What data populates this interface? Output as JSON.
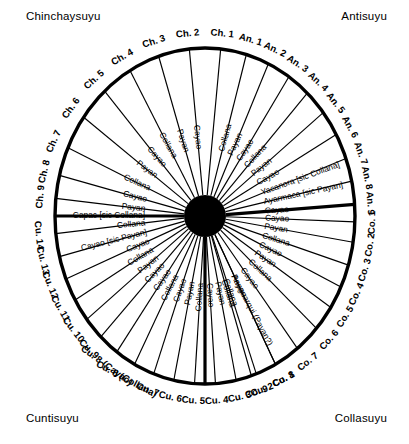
{
  "quadrants": {
    "chinchaysuyu": "Chinchaysuyu",
    "antisuyu": "Antisuyu",
    "cuntisuyu": "Cuntisuyu",
    "collasuyu": "Collasuyu"
  },
  "geometry": {
    "center_x": 205,
    "center_y": 216,
    "radius_x": 150,
    "radius_y": 168,
    "hub_radius": 21
  },
  "chart_data": {
    "type": "radial-diagram",
    "center": "black hub (Cuzco / Coricancha)",
    "quadrant_labels": [
      "Chinchaysuyu",
      "Antisuyu",
      "Collasuyu",
      "Cuntisuyu"
    ],
    "total_rays": 41,
    "quadrants": [
      {
        "name": "Antisuyu",
        "prefix": "An.",
        "ray_count": 9,
        "ray_labels": [
          "An. 1",
          "An. 2",
          "An. 3",
          "An. 4",
          "An. 5",
          "An. 6",
          "An. 7",
          "An. 8",
          "An. 9"
        ],
        "inner_labels": [
          "Collana",
          "Payan",
          "Cayao",
          "Collana",
          "Payan",
          "Cayao",
          "Collana",
          "Payan",
          "Cayao",
          "Yacanora [sic Collana]",
          "Ayarmaca [sic Payan]",
          "Cayao"
        ]
      },
      {
        "name": "Collasuyu",
        "prefix": "Co.",
        "ray_count": 9,
        "ray_labels": [
          "Co. 1",
          "Co. 2",
          "Co. 3",
          "Co. 4",
          "Co. 5",
          "Co. 6",
          "Co. 7",
          "Co. 8",
          "Co. 9"
        ],
        "inner_labels": [
          "Cayao",
          "Payan",
          "Collana",
          "Cayao",
          "Payan",
          "Collana",
          "Cayao",
          "Payan",
          "Collana",
          "Cayao",
          "Payan",
          "Collana",
          "Anaguarqui (Payan?)",
          "Collana"
        ]
      },
      {
        "name": "Cuntisuyu",
        "prefix": "Cu.",
        "ray_count": 14,
        "ray_labels": [
          "Cu. 1",
          "Cu. 2",
          "Cu. 3",
          "Cu. 4",
          "Cu. 5",
          "Cu. 6",
          "Cu. 7",
          "Cu. 8 (Collana)",
          "Cu. 8 (Cayao)",
          "Cu. 9",
          "Cu. 10",
          "Cu. 11",
          "Cu. 12",
          "Cu. 13",
          "Cu. 14"
        ],
        "inner_labels": [
          "Collana",
          "Payan",
          "Cayao",
          "Collana",
          "Cayao",
          "Collana",
          "Payan",
          "Cayao",
          "Collana",
          "Cayao",
          "Cayao [sic Payan]",
          "Collana"
        ]
      },
      {
        "name": "Chinchaysuyu",
        "prefix": "Ch.",
        "ray_count": 9,
        "ray_labels": [
          "Ch. 1",
          "Ch. 2",
          "Ch. 3",
          "Ch. 4",
          "Ch. 5",
          "Ch. 6",
          "Ch. 7",
          "Ch. 8",
          "Ch. 9"
        ],
        "inner_labels": [
          "Cayao",
          "Payan",
          "Collana",
          "Cayao",
          "Payan",
          "Collana",
          "Cayao",
          "Payan",
          "Capac [sic Collana]"
        ]
      }
    ],
    "notes": [
      "Yacanora [sic Collana]",
      "Ayarmaca [sic Payan]",
      "Anaguarqui (Payan?)",
      "Capac [sic Collana]",
      "Cayao [sic Payan]"
    ]
  },
  "rays": [
    {
      "label": "Ch. 1",
      "angle": -84,
      "thick": false,
      "inner": null
    },
    {
      "label": "Ch. 2",
      "angle": -96,
      "thick": false,
      "inner": "Cayao"
    },
    {
      "label": "Ch. 3",
      "angle": -108,
      "thick": false,
      "inner": "Payan"
    },
    {
      "label": "Ch. 4",
      "angle": -120,
      "thick": false,
      "inner": "Collana"
    },
    {
      "label": "Ch. 5",
      "angle": -132,
      "thick": false,
      "inner": "Cayao"
    },
    {
      "label": "Ch. 6",
      "angle": -144,
      "thick": false,
      "inner": "Payan"
    },
    {
      "label": "Ch. 7",
      "angle": -156,
      "thick": false,
      "inner": "Collana"
    },
    {
      "label": "Ch. 8",
      "angle": -166,
      "thick": false,
      "inner": "Cayao"
    },
    {
      "label": "Ch. 9",
      "angle": -174,
      "thick": false,
      "inner": "Payan"
    },
    {
      "label": "",
      "angle": -180,
      "thick": true,
      "inner": "Capac [sic Collana]"
    },
    {
      "label": "Cu. 14",
      "angle": 174,
      "thick": false,
      "inner": "Collana"
    },
    {
      "label": "Cu. 13",
      "angle": 166,
      "thick": false,
      "inner": "Cayao [sic Payan]"
    },
    {
      "label": "Cu. 12",
      "angle": 158,
      "thick": false,
      "inner": "Cayao"
    },
    {
      "label": "Cu. 11",
      "angle": 150,
      "thick": false,
      "inner": "Collana"
    },
    {
      "label": "Cu. 10",
      "angle": 142,
      "thick": false,
      "inner": "Payan"
    },
    {
      "label": "Cu. 9",
      "angle": 134,
      "thick": false,
      "inner": "Cayao"
    },
    {
      "label": "Cu. 8 (Cayao)",
      "angle": 126,
      "thick": false,
      "inner": "Cayao"
    },
    {
      "label": "Cu. 8 (Collana)",
      "angle": 118,
      "thick": false,
      "inner": "Collana"
    },
    {
      "label": "Cu. 7",
      "angle": 110,
      "thick": false,
      "inner": "Cayao"
    },
    {
      "label": "Cu. 6",
      "angle": 102,
      "thick": false,
      "inner": "Payan"
    },
    {
      "label": "Cu. 5",
      "angle": 94,
      "thick": false,
      "inner": "Collana"
    },
    {
      "label": "Cu. 4",
      "angle": 86,
      "thick": false,
      "inner": "Cayao"
    },
    {
      "label": "Cu. 3",
      "angle": 78,
      "thick": false,
      "inner": "Payan"
    },
    {
      "label": "Cu. 2",
      "angle": 70,
      "thick": false,
      "inner": "Collana"
    },
    {
      "label": "Cu. 1",
      "angle": 62,
      "thick": false,
      "inner": "Anaguarqui (Payan?)"
    },
    {
      "label": "",
      "angle": 90,
      "thick": true,
      "inner": null
    },
    {
      "label": "Co. 9",
      "angle": 72,
      "thick": false,
      "inner": "Collana"
    },
    {
      "label": "Co. 8",
      "angle": 62,
      "thick": false,
      "inner": "Payan"
    },
    {
      "label": "Co. 7",
      "angle": 52,
      "thick": false,
      "inner": "Cayao"
    },
    {
      "label": "Co. 6",
      "angle": 42,
      "thick": false,
      "inner": "Collana"
    },
    {
      "label": "Co. 5",
      "angle": 33,
      "thick": false,
      "inner": "Payan"
    },
    {
      "label": "Co. 4",
      "angle": 25,
      "thick": false,
      "inner": "Cayao"
    },
    {
      "label": "Co. 3",
      "angle": 17,
      "thick": false,
      "inner": "Collana"
    },
    {
      "label": "Co. 2",
      "angle": 9,
      "thick": false,
      "inner": "Payan"
    },
    {
      "label": "Co. 1",
      "angle": 2,
      "thick": false,
      "inner": "Cayao"
    },
    {
      "label": "An. 9",
      "angle": -4,
      "thick": true,
      "inner": "Cayao"
    },
    {
      "label": "An. 8",
      "angle": -12,
      "thick": false,
      "inner": "Ayarmaca [sic Payan]"
    },
    {
      "label": "An. 7",
      "angle": -20,
      "thick": false,
      "inner": "Yacanora [sic Collana]"
    },
    {
      "label": "An. 6",
      "angle": -29,
      "thick": false,
      "inner": "Cayao"
    },
    {
      "label": "An. 5",
      "angle": -38,
      "thick": false,
      "inner": "Payan"
    },
    {
      "label": "An. 4",
      "angle": -47,
      "thick": false,
      "inner": "Collana"
    },
    {
      "label": "An. 3",
      "angle": -56,
      "thick": false,
      "inner": "Cayao"
    },
    {
      "label": "An. 2",
      "angle": -65,
      "thick": false,
      "inner": "Payan"
    },
    {
      "label": "An. 1",
      "angle": -74,
      "thick": false,
      "inner": "Collana"
    }
  ]
}
